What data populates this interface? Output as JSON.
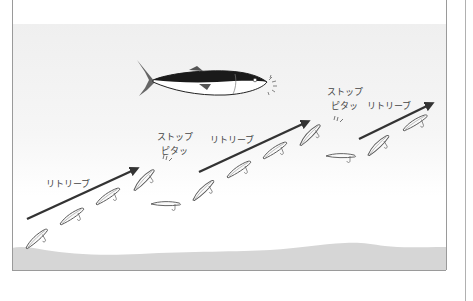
{
  "diagram": {
    "colors": {
      "panel_border": "#9a9a9a",
      "water_top": "#efefef",
      "water_bottom": "#ffffff",
      "seabed": "#d6d6d6",
      "arrow": "#333333",
      "fish_back": "#1a1a1a",
      "fish_belly": "#ffffff",
      "lure_line": "#555555"
    },
    "labels": {
      "retrieve_1": "リトリーブ",
      "stop_1": "ストップ",
      "bite_1": "ピタッ",
      "retrieve_2": "リトリーブ",
      "stop_2": "ストップ",
      "bite_2": "ピタッ",
      "retrieve_3": "リトリーブ"
    },
    "phases": [
      {
        "type": "retrieve",
        "label_key": "retrieve_1",
        "lure_count": 4
      },
      {
        "type": "stop",
        "label_key": "stop_1",
        "sound_key": "bite_1",
        "lure_count": 1
      },
      {
        "type": "retrieve",
        "label_key": "retrieve_2",
        "lure_count": 4
      },
      {
        "type": "stop",
        "label_key": "stop_2",
        "sound_key": "bite_2",
        "lure_count": 1
      },
      {
        "type": "retrieve",
        "label_key": "retrieve_3",
        "lure_count": 2
      }
    ],
    "icons": {
      "fish": "yellowtail-fish-icon",
      "lure": "minnow-lure-icon",
      "arrow": "retrieve-arrow-icon",
      "sound_marks": "vibration-marks-icon",
      "sparkle": "bite-sparkle-icon"
    }
  }
}
